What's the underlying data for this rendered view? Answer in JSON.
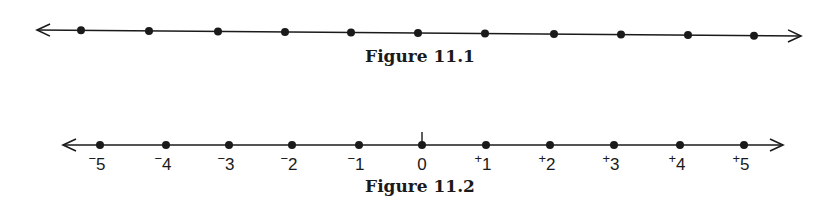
{
  "figures": [
    {
      "id": "fig-11-1",
      "caption": "Figure 11.1",
      "type": "number_line_unlabeled",
      "line": {
        "x1": 37,
        "y1": 30,
        "x2": 801,
        "y2": 36
      },
      "points_x": [
        81,
        149,
        218,
        285,
        351,
        418,
        485,
        554,
        621,
        688,
        754
      ],
      "arrows": [
        "left",
        "right"
      ]
    },
    {
      "id": "fig-11-2",
      "caption": "Figure 11.2",
      "type": "number_line_integers",
      "line": {
        "x1": 63,
        "y1": 145,
        "x2": 783,
        "y2": 145
      },
      "points_x": [
        100,
        166,
        229,
        292,
        359,
        422,
        486,
        550,
        614,
        680,
        744
      ],
      "zero_tick": true,
      "labels": [
        {
          "sign": "⁻",
          "value": "5"
        },
        {
          "sign": "⁻",
          "value": "4"
        },
        {
          "sign": "⁻",
          "value": "3"
        },
        {
          "sign": "⁻",
          "value": "2"
        },
        {
          "sign": "⁻",
          "value": "1"
        },
        {
          "sign": "",
          "value": "0"
        },
        {
          "sign": "⁺",
          "value": "1"
        },
        {
          "sign": "⁺",
          "value": "2"
        },
        {
          "sign": "⁺",
          "value": "3"
        },
        {
          "sign": "⁺",
          "value": "4"
        },
        {
          "sign": "⁺",
          "value": "5"
        }
      ],
      "arrows": [
        "left",
        "right"
      ]
    }
  ],
  "colors": {
    "ink": "#1a1a1a",
    "background": "#ffffff"
  }
}
